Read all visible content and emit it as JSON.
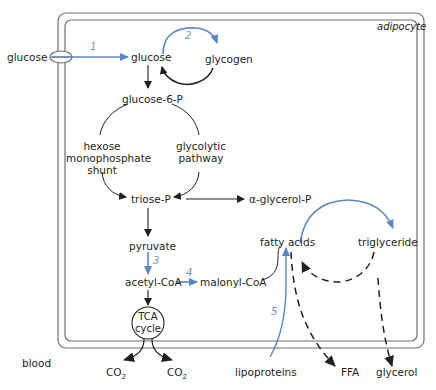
{
  "diagram": {
    "cell_label": "adipocyte",
    "outside_label": "blood",
    "colors": {
      "blue_arrow": "#5b86c4",
      "black_arrow": "#231f20",
      "membrane": "#6d6e71"
    },
    "nodes": {
      "glucose_out": "glucose",
      "glucose_in": "glucose",
      "glycogen": "glycogen",
      "glucose6p": "glucose-6-P",
      "hmp_shunt": [
        "hexose",
        "monophosphate",
        "shunt"
      ],
      "glycolytic": [
        "glycolytic",
        "pathway"
      ],
      "triose_p": "triose-P",
      "alpha_glycerol_p": "α-glycerol-P",
      "pyruvate": "pyruvate",
      "acetyl_coa": "acetyl-CoA",
      "malonyl_coa": "malonyl-CoA",
      "fatty_acids": "fatty acids",
      "triglyceride": "triglyceride",
      "tca": [
        "TCA",
        "cycle"
      ],
      "co2_left": "CO",
      "co2_right": "CO",
      "co2_sub": "2",
      "lipoproteins": "lipoproteins",
      "ffa": "FFA",
      "glycerol": "glycerol"
    },
    "step_numbers": [
      "1",
      "2",
      "3",
      "4",
      "5"
    ]
  }
}
